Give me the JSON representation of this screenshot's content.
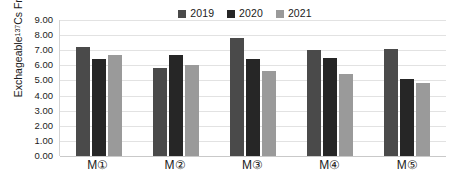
{
  "chart_data": {
    "type": "bar",
    "title": "",
    "xlabel": "",
    "ylabel": "Exchageable 137Cs Fraction(%)",
    "ylabel_prefix": "Exchageable ",
    "ylabel_superscript": "137",
    "ylabel_suffix": "Cs Fraction(%)",
    "categories": [
      "M①",
      "M②",
      "M③",
      "M④",
      "M⑤"
    ],
    "series": [
      {
        "name": "2019",
        "color": "#4a4a4a",
        "values": [
          7.2,
          5.8,
          7.8,
          7.0,
          7.1
        ]
      },
      {
        "name": "2020",
        "color": "#262626",
        "values": [
          6.45,
          6.7,
          6.4,
          6.5,
          5.1
        ]
      },
      {
        "name": "2021",
        "color": "#9a9a9a",
        "values": [
          6.7,
          6.05,
          5.65,
          5.4,
          4.8
        ]
      }
    ],
    "ylim": [
      0,
      9
    ],
    "ytick_step": 1,
    "ytick_labels": [
      "9.00",
      "8.00",
      "7.00",
      "6.00",
      "5.00",
      "4.00",
      "3.00",
      "2.00",
      "1.00",
      "0.00"
    ],
    "ytick_values": [
      9,
      8,
      7,
      6,
      5,
      4,
      3,
      2,
      1,
      0
    ],
    "grid": true,
    "legend_position": "top-right",
    "background": "#ffffff",
    "gridline_color": "#e2e2e2"
  }
}
